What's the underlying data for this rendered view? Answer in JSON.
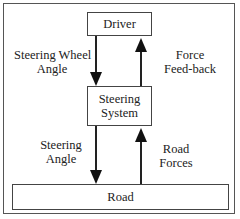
{
  "diagram": {
    "nodes": {
      "driver": "Driver",
      "steering_system_line1": "Steering",
      "steering_system_line2": "System",
      "road": "Road"
    },
    "edges": {
      "steering_wheel_angle_line1": "Steering Wheel",
      "steering_wheel_angle_line2": "Angle",
      "force_feedback_line1": "Force",
      "force_feedback_line2": "Feed-back",
      "steering_angle_line1": "Steering",
      "steering_angle_line2": "Angle",
      "road_forces_line1": "Road",
      "road_forces_line2": "Forces"
    },
    "colors": {
      "line": "#222222",
      "border": "#555555"
    }
  }
}
